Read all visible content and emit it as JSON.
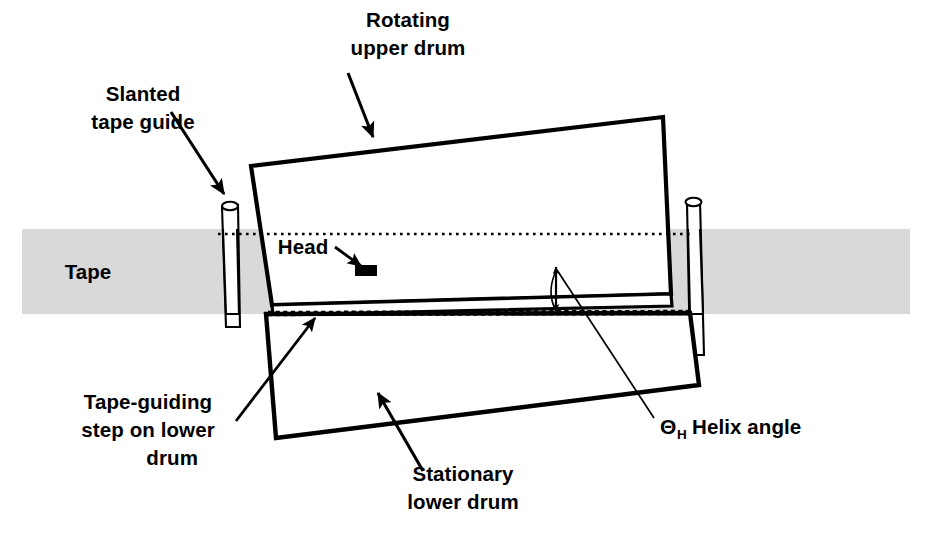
{
  "figure": {
    "kind": "helical-scan-drum-cross-section",
    "background_color": "#ffffff",
    "ink_color": "#000000",
    "tape_fill_color": "#d9d9d9"
  },
  "labels": {
    "slanted_tape_guide": {
      "line1": "Slanted",
      "line2": "tape guide"
    },
    "rotating_upper_drum": {
      "line1": "Rotating",
      "line2": "upper drum"
    },
    "head": "Head",
    "tape": "Tape",
    "tape_guiding_step": {
      "line1": "Tape-guiding",
      "line2": "step on lower",
      "line3": "drum"
    },
    "stationary_lower_drum": {
      "line1": "Stationary",
      "line2": "lower drum"
    },
    "helix_angle": {
      "symbol": "Θ",
      "subscript": "H",
      "text": "Helix angle"
    }
  },
  "parts": {
    "upper_drum": "Rotating upper drum",
    "lower_drum": "Stationary lower drum",
    "head": "Head",
    "tape": "Tape",
    "left_guide": "Slanted tape guide (left)",
    "right_guide": "Slanted tape guide (right)",
    "step": "Tape-guiding step on lower drum",
    "reference_line_upper": "Horizontal reference dotted line",
    "reference_line_step": "Dashed step line on lower drum",
    "helix_angle_arc": "Helix angle arc"
  }
}
